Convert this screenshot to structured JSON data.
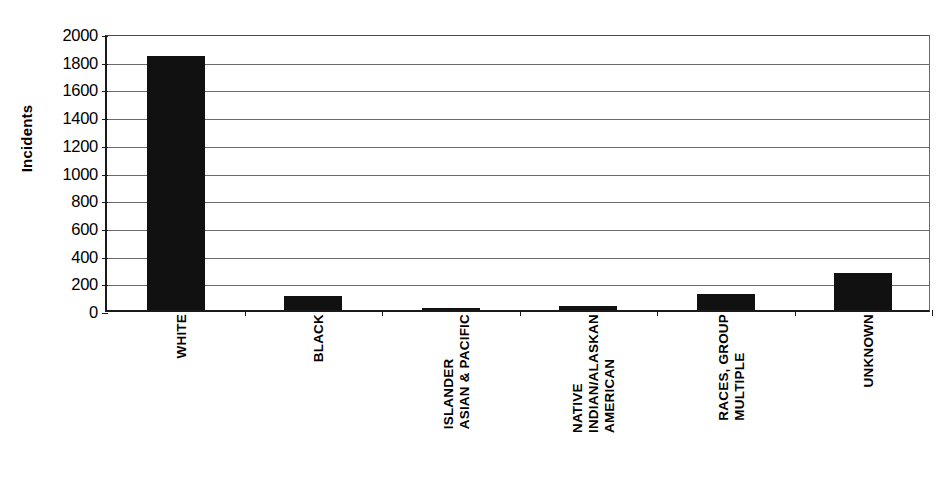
{
  "chart_data": {
    "type": "bar",
    "title": "",
    "subtitle": "",
    "xlabel": "",
    "ylabel": "Incidents",
    "ylim": [
      0,
      2000
    ],
    "ytick_step": 200,
    "yticks": [
      "2000",
      "1800",
      "1600",
      "1400",
      "1200",
      "1000",
      "800",
      "600",
      "400",
      "200",
      "0"
    ],
    "grid": true,
    "legend": "none",
    "orientation": "vertical",
    "bar_color": "#111111",
    "axis_color": "#1a1a1a",
    "gridline_color": "#6b6b6b",
    "categories": [
      "WHITE",
      "BLACK",
      "ASIAN & PACIFIC ISLANDER",
      "AMERICAN INDIAN/ALASKAN NATIVE",
      "MULTIPLE RACES, GROUP",
      "UNKNOWN"
    ],
    "category_label_lines": [
      [
        "WHITE"
      ],
      [
        "BLACK"
      ],
      [
        "ASIAN & PACIFIC",
        "ISLANDER"
      ],
      [
        "AMERICAN",
        "INDIAN/ALASKAN",
        "NATIVE"
      ],
      [
        "MULTIPLE",
        "RACES, GROUP"
      ],
      [
        "UNKNOWN"
      ]
    ],
    "values": [
      1835,
      100,
      18,
      28,
      115,
      270
    ]
  },
  "clipped_header": {
    "text": ""
  }
}
